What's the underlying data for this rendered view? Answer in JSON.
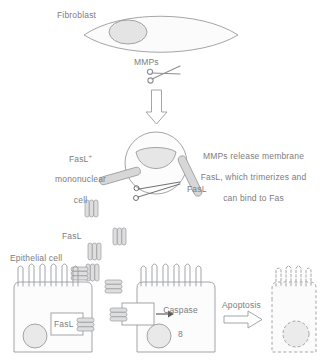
{
  "diagram": {
    "labels": {
      "fibroblast": "Fibroblast",
      "mmps": "MMPs",
      "mononuclear_cell_line1": "FasL",
      "mononuclear_cell_sup": "+",
      "mononuclear_cell_line2": "mononuclear",
      "mononuclear_cell_line3": "cell",
      "explanation_line1": "MMPs release membrane",
      "explanation_line2": "FasL, which trimerizes and",
      "explanation_line3": "can bind to Fas",
      "fasl_stalk": "FasL",
      "fasl_free": "FasL",
      "epithelial_cell": "Epithelial cell",
      "fasl_receptor": "FasL",
      "caspase_line1": "Caspase",
      "caspase_line2": "8",
      "apoptosis": "Apoptosis"
    },
    "icons": {
      "scissors_top": "scissors-icon",
      "scissors_cleave": "scissors-icon",
      "arrow_down": "down-arrow-icon",
      "arrow_apoptosis": "right-arrow-icon",
      "arrow_caspase": "small-right-arrow-icon"
    },
    "colors": {
      "outline": "#9a9b9e",
      "fill_light": "#f4f4f5",
      "fill_nucleus": "#e3e3e4",
      "text": "#7c7d80",
      "trimer_fill": "#dededf",
      "stalk_fill": "#d9d9da",
      "arrow_stroke": "#8e8f92"
    },
    "counts": {
      "free_trimers_vertical": 3,
      "free_trimers_horizontal": 4,
      "epithelial_cells": 2,
      "apoptotic_cells": 1
    }
  }
}
